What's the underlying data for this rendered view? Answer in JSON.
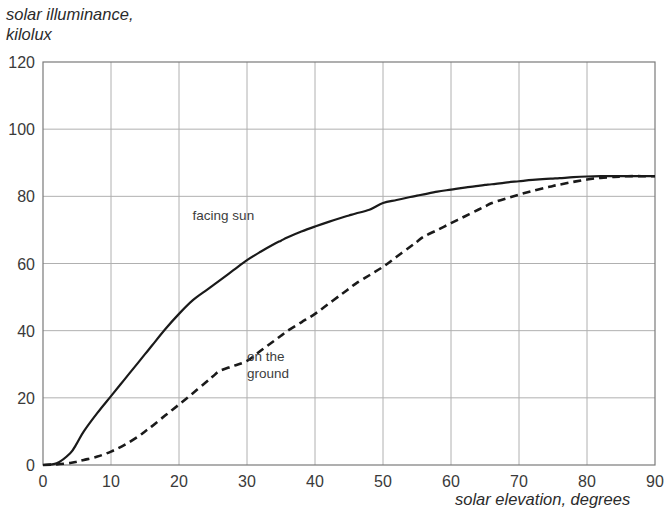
{
  "chart_data": {
    "type": "line",
    "title": "",
    "ylabel": "solar illuminance,\nkilolux",
    "xlabel": "solar elevation, degrees",
    "xlim": [
      0,
      90
    ],
    "ylim": [
      0,
      120
    ],
    "xticks": [
      "0",
      "10",
      "20",
      "30",
      "40",
      "50",
      "60",
      "70",
      "80",
      "90"
    ],
    "yticks": [
      "0",
      "20",
      "40",
      "60",
      "80",
      "100",
      "120"
    ],
    "xtick_values": [
      0,
      10,
      20,
      30,
      40,
      50,
      60,
      70,
      80,
      90
    ],
    "ytick_values": [
      0,
      20,
      40,
      60,
      80,
      100,
      120
    ],
    "grid": true,
    "legend_position": "inline-annotations",
    "x": [
      0,
      2,
      4,
      5,
      6,
      8,
      10,
      12,
      14,
      15,
      16,
      18,
      20,
      22,
      24,
      25,
      26,
      28,
      30,
      32,
      34,
      35,
      36,
      38,
      40,
      42,
      44,
      45,
      46,
      48,
      50,
      52,
      54,
      55,
      56,
      58,
      60,
      62,
      64,
      65,
      66,
      68,
      70,
      72,
      74,
      75,
      76,
      78,
      80,
      82,
      84,
      85,
      86,
      88,
      90
    ],
    "series": [
      {
        "name": "facing sun",
        "style": "solid",
        "color": "#1a1a1a",
        "label_x": 22,
        "label_y": 73,
        "values": [
          0,
          0.5,
          3.5,
          6.5,
          10,
          15.5,
          20.5,
          25.5,
          30.5,
          33,
          35.5,
          40.5,
          45,
          49,
          52,
          53.5,
          55,
          58,
          61,
          63.5,
          65.8,
          66.8,
          67.8,
          69.5,
          71,
          72.4,
          73.7,
          74.3,
          74.9,
          76,
          78,
          78.9,
          79.8,
          80.2,
          80.6,
          81.4,
          82,
          82.6,
          83.1,
          83.4,
          83.6,
          84.1,
          84.5,
          84.9,
          85.2,
          85.3,
          85.4,
          85.7,
          85.9,
          86,
          86,
          86,
          86,
          86,
          86
        ]
      },
      {
        "name": "on the ground",
        "style": "dashed",
        "color": "#1a1a1a",
        "label_x": 30,
        "label_y": 31,
        "values": [
          0,
          0.2,
          0.6,
          1.0,
          1.5,
          2.5,
          4.0,
          6.0,
          8.5,
          10.0,
          11.5,
          14.8,
          18.0,
          21.3,
          24.7,
          26.4,
          28.0,
          29.5,
          31.0,
          34.0,
          37.0,
          38.5,
          40.0,
          42.5,
          45.0,
          48.0,
          51.0,
          52.5,
          54.0,
          56.5,
          59.0,
          62.0,
          65.0,
          66.5,
          68.0,
          70.0,
          72.0,
          74.0,
          76.0,
          77.0,
          78.0,
          79.3,
          80.5,
          81.6,
          82.6,
          83.1,
          83.5,
          84.3,
          85.0,
          85.5,
          85.8,
          85.9,
          86,
          86,
          86
        ]
      }
    ],
    "annotations": [
      {
        "text": "facing sun",
        "x": 22,
        "y": 73
      },
      {
        "text_line1": "on the",
        "text_line2": "ground",
        "x": 30,
        "y": 31
      }
    ],
    "colors": {
      "grid": "#b0b0b0",
      "axis": "#7a7a7a",
      "line": "#1a1a1a",
      "text": "#2b2b2b",
      "background": "#ffffff"
    }
  },
  "labels": {
    "facing_sun": "facing sun",
    "on_the_ground_line1": "on the",
    "on_the_ground_line2": "ground",
    "y_axis_line1": "solar illuminance,",
    "y_axis_line2": "kilolux",
    "x_axis": "solar elevation, degrees"
  }
}
